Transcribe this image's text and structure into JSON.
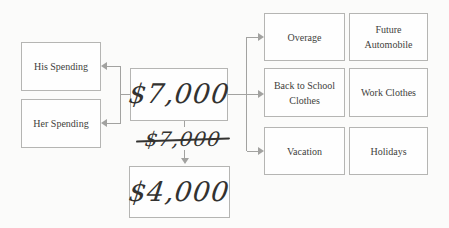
{
  "diagram": {
    "spenders": [
      {
        "label": "His Spending"
      },
      {
        "label": "Her Spending"
      }
    ],
    "total": {
      "amount": "$7,000"
    },
    "struck_total": {
      "amount": "$7,000"
    },
    "revised_total": {
      "amount": "$4,000"
    },
    "categories": [
      {
        "label": "Overage"
      },
      {
        "label": "Future Automobile"
      },
      {
        "label": "Back to School Clothes"
      },
      {
        "label": "Work Clothes"
      },
      {
        "label": "Vacation"
      },
      {
        "label": "Holidays"
      }
    ],
    "colors": {
      "background": "#fbfbfa",
      "box_border": "#b5b5b3",
      "box_fill": "#fefefe",
      "connector": "#a2a2a0",
      "label_text": "#3f3e3c",
      "handwriting": "#333230"
    }
  }
}
